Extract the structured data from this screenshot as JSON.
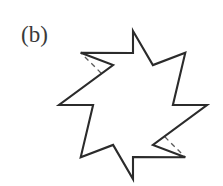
{
  "figure": {
    "panel_label": "(b)",
    "caption_alt": "Eight-pointed star with dashed fold lines",
    "canvas": {
      "width": 223,
      "height": 186,
      "background": "#ffffff"
    },
    "label_color": "#3a3a3a",
    "outline_color": "#2b2b2b",
    "outline_width": 2.1,
    "fill_color": "#ffffff",
    "dash_color": "#5a5a5a",
    "dash_width": 1.3,
    "dash_pattern": "5,4"
  },
  "shape": {
    "type": "star-polygon",
    "points_count": 8,
    "center": {
      "x": 133,
      "y": 105
    },
    "outer_radius": 74,
    "inner_radius": 52,
    "rotation_deg": -90,
    "outer_vertices": [
      {
        "name": "tip-top",
        "x": 133,
        "y": 31
      },
      {
        "name": "tip-upper-right",
        "x": 185.3,
        "y": 52.7
      },
      {
        "name": "tip-right",
        "x": 207,
        "y": 105
      },
      {
        "name": "tip-lower-right",
        "x": 185.3,
        "y": 157.3
      },
      {
        "name": "tip-bottom",
        "x": 133,
        "y": 179
      },
      {
        "name": "tip-lower-left",
        "x": 80.7,
        "y": 157.3
      },
      {
        "name": "tip-left",
        "x": 59,
        "y": 105
      },
      {
        "name": "tip-upper-left",
        "x": 80.7,
        "y": 52.7
      }
    ],
    "inner_vertices": [
      {
        "name": "valley-upper-right-near-top",
        "x": 152.9,
        "y": 65.1
      },
      {
        "name": "valley-right-upper",
        "x": 172.9,
        "y": 105
      },
      {
        "name": "valley-right-lower",
        "x": 152.9,
        "y": 144.9
      },
      {
        "name": "valley-bottom-right",
        "x": 133,
        "y": 157
      },
      {
        "name": "valley-bottom-left",
        "x": 113.1,
        "y": 144.9
      },
      {
        "name": "valley-left-lower",
        "x": 93.1,
        "y": 105
      },
      {
        "name": "valley-left-upper",
        "x": 113.1,
        "y": 65.1
      },
      {
        "name": "valley-top",
        "x": 133,
        "y": 53
      }
    ],
    "fold_lines": [
      {
        "name": "fold-to-tip-top",
        "x1": 133,
        "y1": 105,
        "x2": 133,
        "y2": 31
      },
      {
        "name": "fold-to-tip-upper-right",
        "x1": 133,
        "y1": 105,
        "x2": 185.3,
        "y2": 52.7
      },
      {
        "name": "fold-to-tip-right",
        "x1": 133,
        "y1": 105,
        "x2": 207,
        "y2": 105
      },
      {
        "name": "fold-to-tip-lower-right",
        "x1": 133,
        "y1": 105,
        "x2": 185.3,
        "y2": 157.3
      },
      {
        "name": "fold-to-tip-bottom",
        "x1": 133,
        "y1": 105,
        "x2": 133,
        "y2": 179
      },
      {
        "name": "fold-to-tip-lower-left",
        "x1": 133,
        "y1": 105,
        "x2": 80.7,
        "y2": 157.3
      },
      {
        "name": "fold-to-tip-left",
        "x1": 133,
        "y1": 105,
        "x2": 59,
        "y2": 105
      },
      {
        "name": "fold-to-tip-upper-left",
        "x1": 133,
        "y1": 105,
        "x2": 80.7,
        "y2": 52.7
      }
    ]
  }
}
